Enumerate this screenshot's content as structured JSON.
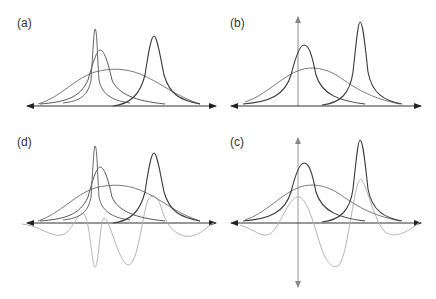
{
  "figure": {
    "panels": [
      {
        "id": "a",
        "label": "(a)",
        "description": "Three peaks: narrow spike, medium peak, broad peak, plus a second peak on the right; horizontal axis only"
      },
      {
        "id": "b",
        "label": "(b)",
        "description": "Medium peak, broad peak and right peak with vertical axis"
      },
      {
        "id": "d",
        "label": "(d)",
        "description": "Same curves as (a) plus light-gray oscillating difference/derivative curve"
      },
      {
        "id": "c",
        "label": "(c)",
        "description": "Same curves as (b) plus light-gray oscillating difference curve; vertical axis extends both directions"
      }
    ],
    "colors": {
      "dark_curve": "#3a3a3a",
      "mid_curve": "#6e6e6e",
      "light_curve": "#b4b4b4",
      "axis": "#333333",
      "vertical_axis": "#888888"
    }
  }
}
